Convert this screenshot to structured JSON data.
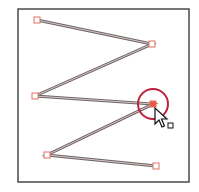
{
  "canvas": {
    "width": 199,
    "height": 192,
    "background": "#ffffff"
  },
  "artboard": {
    "x": 18,
    "y": 9,
    "width": 171,
    "height": 173,
    "stroke": "#4a4a4a"
  },
  "path": {
    "stroke_outer": "#6e6464",
    "stroke_inner": "#d8c8c8",
    "anchors": [
      {
        "x": 37,
        "y": 20,
        "selected": false
      },
      {
        "x": 152,
        "y": 44,
        "selected": false
      },
      {
        "x": 35,
        "y": 96,
        "selected": false
      },
      {
        "x": 153,
        "y": 104,
        "selected": true
      },
      {
        "x": 47,
        "y": 155,
        "selected": false
      },
      {
        "x": 156,
        "y": 166,
        "selected": false
      }
    ]
  },
  "anchor_style": {
    "size": 6,
    "stroke": "#e07060",
    "fill": "#ffffff",
    "selected_fill": "#e85a40"
  },
  "highlight_circle": {
    "cx": 153,
    "cy": 104,
    "r": 15,
    "stroke": "#c0203a"
  },
  "cursor": {
    "x": 155,
    "y": 108,
    "icon": "direct-selection-arrow-icon",
    "badge": "anchor-square-badge"
  }
}
